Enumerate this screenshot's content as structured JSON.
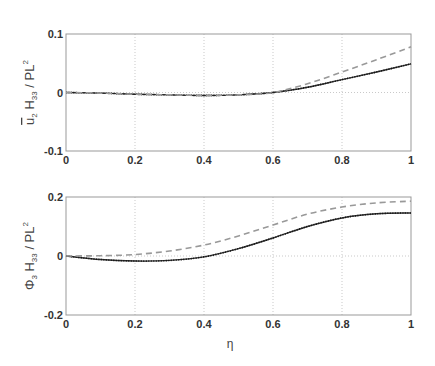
{
  "chart_data": [
    {
      "type": "line",
      "title": "",
      "xlabel": "",
      "ylabel": "ū2 H33 / PL^2",
      "ylabel_parts": {
        "base": "u",
        "base_sub": "2",
        "mid": "H",
        "mid_sub": "33",
        "tail": "/ PL",
        "tail_sup": "2"
      },
      "xlim": [
        0,
        1
      ],
      "ylim": [
        -0.1,
        0.1
      ],
      "xticks": [
        "0",
        "0.2",
        "0.4",
        "0.6",
        "0.8",
        "1"
      ],
      "yticks": [
        "-0.1",
        "0",
        "0.1"
      ],
      "grid": true,
      "x": [
        0,
        0.1,
        0.2,
        0.3,
        0.4,
        0.5,
        0.6,
        0.7,
        0.8,
        0.9,
        1.0
      ],
      "series": [
        {
          "name": "solid",
          "style": "solid-dotted",
          "color": "#333333",
          "values": [
            0,
            -0.001,
            -0.003,
            -0.004,
            -0.005,
            -0.004,
            0,
            0.009,
            0.022,
            0.035,
            0.049
          ]
        },
        {
          "name": "dashed",
          "style": "dashed",
          "color": "#999999",
          "values": [
            0,
            -0.001,
            -0.003,
            -0.004,
            -0.005,
            -0.004,
            0,
            0.015,
            0.035,
            0.056,
            0.078
          ]
        }
      ]
    },
    {
      "type": "line",
      "title": "",
      "xlabel": "η",
      "ylabel": "Φ3 H33 / PL^2",
      "ylabel_parts": {
        "base": "Φ",
        "base_sub": "3",
        "mid": "H",
        "mid_sub": "33",
        "tail": "/ PL",
        "tail_sup": "2"
      },
      "xlim": [
        0,
        1
      ],
      "ylim": [
        -0.2,
        0.2
      ],
      "xticks": [
        "0",
        "0.2",
        "0.4",
        "0.6",
        "0.8",
        "1"
      ],
      "yticks": [
        "-0.2",
        "0",
        "0.2"
      ],
      "grid": true,
      "x": [
        0,
        0.1,
        0.2,
        0.3,
        0.4,
        0.5,
        0.6,
        0.7,
        0.8,
        0.9,
        1.0
      ],
      "series": [
        {
          "name": "solid",
          "style": "solid-dotted",
          "color": "#333333",
          "values": [
            0,
            -0.012,
            -0.017,
            -0.015,
            -0.003,
            0.025,
            0.061,
            0.1,
            0.129,
            0.143,
            0.146
          ]
        },
        {
          "name": "dashed",
          "style": "dashed",
          "color": "#999999",
          "values": [
            0,
            0.001,
            0.005,
            0.017,
            0.037,
            0.068,
            0.105,
            0.142,
            0.166,
            0.18,
            0.186
          ]
        }
      ]
    }
  ]
}
